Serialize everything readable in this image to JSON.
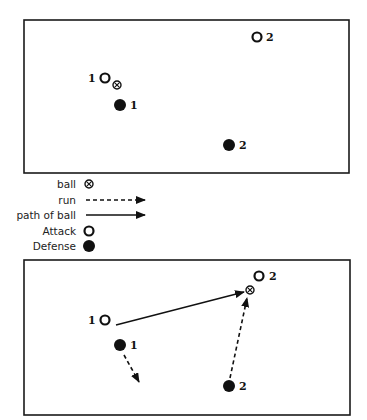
{
  "colors": {
    "ink": "#111111",
    "frame": "#1a1a1a",
    "background": "#ffffff"
  },
  "legend": {
    "items": [
      {
        "label": "ball",
        "icon": "ball-icon"
      },
      {
        "label": "run",
        "icon": "dashed-arrow-icon"
      },
      {
        "label": "path of ball",
        "icon": "solid-arrow-icon"
      },
      {
        "label": "Attack",
        "icon": "open-circle-icon"
      },
      {
        "label": "Defense",
        "icon": "filled-circle-icon"
      }
    ]
  },
  "diagram1": {
    "attackers": [
      {
        "label": "1",
        "x": 105,
        "y": 78
      },
      {
        "label": "2",
        "x": 257,
        "y": 37
      }
    ],
    "defenders": [
      {
        "label": "1",
        "x": 120,
        "y": 105
      },
      {
        "label": "2",
        "x": 229,
        "y": 145
      }
    ],
    "ball": {
      "x": 117,
      "y": 85
    }
  },
  "diagram2": {
    "attackers": [
      {
        "label": "1",
        "x": 105,
        "y": 320
      },
      {
        "label": "2",
        "x": 259,
        "y": 276
      }
    ],
    "defenders": [
      {
        "label": "1",
        "x": 120,
        "y": 345
      },
      {
        "label": "2",
        "x": 229,
        "y": 386
      }
    ],
    "ball": {
      "x": 250,
      "y": 290
    },
    "paths": [
      {
        "type": "pass",
        "from": [
          116,
          325
        ],
        "to": [
          244,
          292
        ]
      },
      {
        "type": "run",
        "from": [
          124,
          355
        ],
        "to": [
          139,
          382
        ]
      },
      {
        "type": "run",
        "from": [
          230,
          378
        ],
        "to": [
          247,
          298
        ]
      }
    ]
  }
}
